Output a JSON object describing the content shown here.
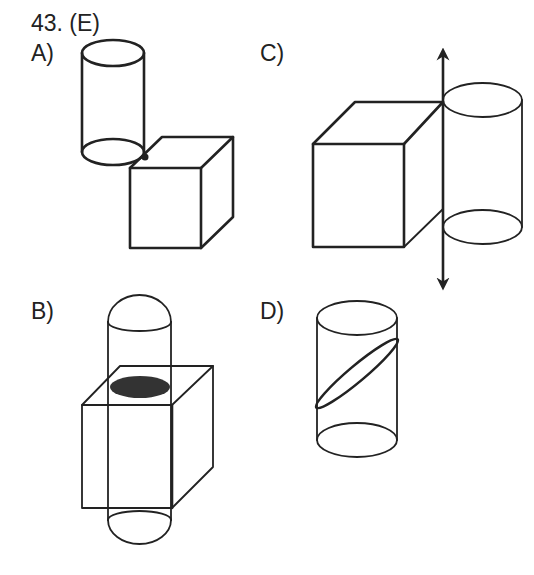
{
  "question": {
    "number_label": "43. (E)"
  },
  "options": [
    {
      "id": "A",
      "label": "A)",
      "description": "Cylinder above cube, touching at cube's top-front-left corner"
    },
    {
      "id": "B",
      "label": "B)",
      "description": "Cylinder passing vertically through cube with shaded cross-section ellipse"
    },
    {
      "id": "C",
      "label": "C)",
      "description": "Cube and cylinder sharing a vertical rotation axis with double-headed arrow"
    },
    {
      "id": "D",
      "label": "D)",
      "description": "Cylinder with diagonal elliptical cross-section"
    }
  ],
  "colors": {
    "line": "#222222",
    "shade": "#333333",
    "background": "#ffffff"
  }
}
